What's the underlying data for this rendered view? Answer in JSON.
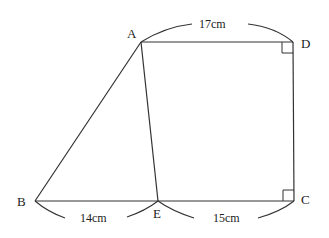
{
  "figure": {
    "type": "geometry",
    "shape": "pentagon-like figure with trapezoid ABCD split by segment AE",
    "colors": {
      "line": "#333333",
      "text": "#222222",
      "background": "#ffffff"
    }
  },
  "vertices": {
    "A": {
      "label": "A",
      "x": 141,
      "y": 42
    },
    "B": {
      "label": "B",
      "x": 35,
      "y": 201
    },
    "C": {
      "label": "C",
      "x": 294,
      "y": 201
    },
    "D": {
      "label": "D",
      "x": 293,
      "y": 42
    },
    "E": {
      "label": "E",
      "x": 158,
      "y": 201
    }
  },
  "segments": [
    "AD",
    "DC",
    "CB",
    "BA",
    "AE"
  ],
  "right_angles": [
    "D",
    "C"
  ],
  "measurements": {
    "AD": "17cm",
    "BE": "14cm",
    "EC": "15cm"
  }
}
